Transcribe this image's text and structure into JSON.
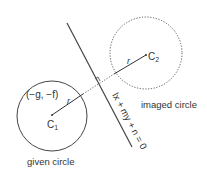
{
  "diagram": {
    "given_circle": {
      "label": "given circle",
      "center_label": "C",
      "center_sub": "1",
      "center_coords": "(−g, −f)",
      "radius_label": "r"
    },
    "imaged_circle": {
      "label": "imaged circle",
      "center_label": "C",
      "center_sub": "2",
      "radius_label": "r"
    },
    "mirror_line": {
      "equation": "lx + my + n = 0"
    },
    "colors": {
      "stroke": "#444444",
      "text": "#333333"
    }
  }
}
